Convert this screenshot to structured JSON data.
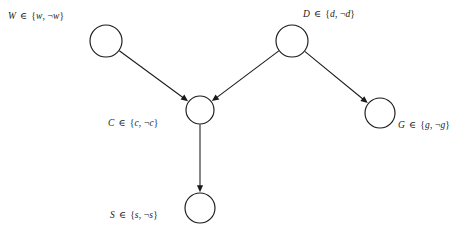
{
  "diagram": {
    "type": "bayesian-network",
    "title": "",
    "background_color": "#ffffff",
    "stroke_color": "#1a1a1a",
    "nodes": [
      {
        "id": "W",
        "label": "W ∈ {w, ¬w}",
        "variable": "W",
        "member_symbol": "∈",
        "domain_values": [
          "w",
          "¬w"
        ],
        "cx": 106,
        "cy": 41,
        "r": 16,
        "label_x": 8,
        "label_y": 12
      },
      {
        "id": "D",
        "label": "D ∈ {d, ¬d}",
        "variable": "D",
        "member_symbol": "∈",
        "domain_values": [
          "d",
          "¬d"
        ],
        "cx": 292,
        "cy": 41,
        "r": 16,
        "label_x": 303,
        "label_y": 10
      },
      {
        "id": "C",
        "label": "C ∈ {c, ¬c}",
        "variable": "C",
        "member_symbol": "∈",
        "domain_values": [
          "c",
          "¬c"
        ],
        "cx": 200,
        "cy": 110,
        "r": 14,
        "label_x": 108,
        "label_y": 119
      },
      {
        "id": "G",
        "label": "G ∈ {g, ¬g}",
        "variable": "G",
        "member_symbol": "∈",
        "domain_values": [
          "g",
          "¬g"
        ],
        "cx": 380,
        "cy": 113,
        "r": 15,
        "label_x": 398,
        "label_y": 121
      },
      {
        "id": "S",
        "label": "S ∈ {s, ¬s}",
        "variable": "S",
        "member_symbol": "∈",
        "domain_values": [
          "s",
          "¬s"
        ],
        "cx": 200,
        "cy": 208,
        "r": 15,
        "label_x": 110,
        "label_y": 211
      }
    ],
    "edges": [
      {
        "id": "W-C",
        "from": "W",
        "to": "C",
        "directed": true
      },
      {
        "id": "D-C",
        "from": "D",
        "to": "C",
        "directed": true
      },
      {
        "id": "D-G",
        "from": "D",
        "to": "G",
        "directed": true
      },
      {
        "id": "C-S",
        "from": "C",
        "to": "S",
        "directed": true
      }
    ]
  }
}
